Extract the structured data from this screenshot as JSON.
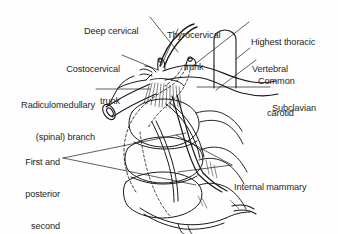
{
  "figure": {
    "kind": "anatomical-line-diagram",
    "background_color": "#fefefe",
    "ink_color": "#1a1a1a",
    "text_color": "#262626"
  },
  "labels": [
    {
      "id": "deep-cervical",
      "text": "Deep cervical",
      "lines": [
        "Deep cervical"
      ],
      "align": "left",
      "x": 84,
      "y": 5
    },
    {
      "id": "thyrocervical-trunk",
      "text": "Thyrocervical trunk",
      "lines": [
        "Thyrocervical",
        "trunk"
      ],
      "align": "center",
      "x": 167,
      "y": 9
    },
    {
      "id": "highest-thoracic",
      "text": "Highest thoracic",
      "lines": [
        "Highest thoracic"
      ],
      "align": "left",
      "x": 251,
      "y": 16
    },
    {
      "id": "costocervical-trunk",
      "text": "Costocervical trunk",
      "lines": [
        "Costocervical",
        "trunk"
      ],
      "align": "right",
      "x": 60,
      "y": 43
    },
    {
      "id": "vertebral",
      "text": "Vertebral",
      "lines": [
        "Vertebral"
      ],
      "align": "left",
      "x": 252,
      "y": 43
    },
    {
      "id": "common-carotid",
      "text": "Common carotid",
      "lines": [
        "Common",
        "carotid"
      ],
      "align": "left",
      "x": 258,
      "y": 55
    },
    {
      "id": "radiculomedullary-spinal-branch",
      "text": "Radiculomedullary (spinal) branch",
      "lines": [
        "Radiculomedullary",
        "(spinal) branch"
      ],
      "align": "right",
      "x": 14,
      "y": 79
    },
    {
      "id": "subclavian",
      "text": "Subclavian",
      "lines": [
        "Subclavian"
      ],
      "align": "left",
      "x": 272,
      "y": 82
    },
    {
      "id": "first-and-posterior-second-intercostal",
      "text": "First and posterior second intercostal",
      "lines": [
        "First and",
        "posterior",
        "second",
        "intercostal"
      ],
      "align": "right",
      "x": 13,
      "y": 136
    },
    {
      "id": "internal-mammary",
      "text": "Internal mammary",
      "lines": [
        "Internal mammary"
      ],
      "align": "left",
      "x": 234,
      "y": 161
    }
  ],
  "leaders": [
    {
      "id": "leader-deep-cervical",
      "from": [
        150,
        17
      ],
      "to": [
        178,
        52
      ]
    },
    {
      "id": "leader-thyrocervical-trunk",
      "from": [
        178,
        29
      ],
      "to": [
        161,
        66
      ]
    },
    {
      "id": "leader-highest-thoracic",
      "from": [
        249,
        22
      ],
      "to": [
        190,
        68
      ]
    },
    {
      "id": "leader-costocervical-trunk",
      "from": [
        122,
        55
      ],
      "to": [
        158,
        70
      ]
    },
    {
      "id": "leader-vertebral",
      "from": [
        250,
        48
      ],
      "to": [
        236,
        59
      ]
    },
    {
      "id": "leader-common-carotid",
      "from": [
        256,
        60
      ],
      "to": [
        216,
        90
      ]
    },
    {
      "id": "leader-radiculomedullary",
      "from": [
        96,
        89
      ],
      "to": [
        150,
        89
      ]
    },
    {
      "id": "leader-subclavian",
      "from": [
        270,
        87
      ],
      "to": [
        197,
        87
      ]
    },
    {
      "id": "leader-intercostal-upper",
      "from": [
        63,
        158
      ],
      "to": [
        186,
        133
      ]
    },
    {
      "id": "leader-intercostal-lower",
      "from": [
        63,
        158
      ],
      "to": [
        196,
        185
      ]
    },
    {
      "id": "leader-mammary-upper",
      "from": [
        232,
        165
      ],
      "to": [
        176,
        135
      ]
    },
    {
      "id": "leader-mammary-lower",
      "from": [
        232,
        165
      ],
      "to": [
        178,
        172
      ]
    }
  ]
}
